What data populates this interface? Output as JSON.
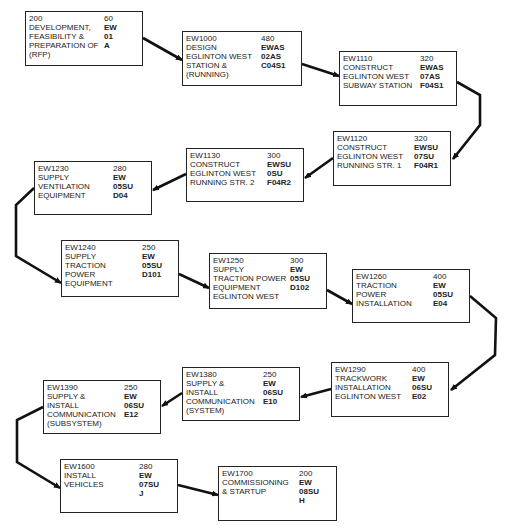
{
  "diagram": {
    "type": "activity-flow",
    "nodes": [
      {
        "id": "n0",
        "x": 25,
        "y": 11,
        "w": 118,
        "h": 55,
        "rx": 78,
        "lines": [
          "200",
          "DEVELOPMENT,",
          "FEASIBILITY &",
          "PREPARATION OF",
          "(RFP)"
        ],
        "right": [
          "60",
          "EW",
          "01",
          "A"
        ]
      },
      {
        "id": "n1",
        "x": 182,
        "y": 31,
        "w": 120,
        "h": 55,
        "rx": 78,
        "lines": [
          "EW1000",
          "DESIGN",
          "EGLINTON WEST",
          "STATION &",
          "(RUNNING)"
        ],
        "right": [
          "480",
          "EWAS",
          "02AS",
          "C04S1"
        ]
      },
      {
        "id": "n2",
        "x": 339,
        "y": 51,
        "w": 118,
        "h": 55,
        "rx": 80,
        "lines": [
          "EW1110",
          "CONSTRUCT",
          "EGLINTON WEST",
          "SUBWAY STATION"
        ],
        "right": [
          "320",
          "EWAS",
          "07AS",
          "F04S1"
        ]
      },
      {
        "id": "n3",
        "x": 333,
        "y": 131,
        "w": 118,
        "h": 55,
        "rx": 80,
        "lines": [
          "EW1120",
          "CONSTRUCT",
          "EGLINTON WEST",
          "RUNNING STR. 1"
        ],
        "right": [
          "320",
          "EWSU",
          "07SU",
          "F04R1"
        ]
      },
      {
        "id": "n4",
        "x": 186,
        "y": 148,
        "w": 118,
        "h": 54,
        "rx": 80,
        "lines": [
          "EW1130",
          "CONSTRUCT",
          "EGLINTON WEST",
          "RUNNING STR. 2"
        ],
        "right": [
          "300",
          "EWSU",
          "0SU",
          "F04R2"
        ]
      },
      {
        "id": "n5",
        "x": 34,
        "y": 161,
        "w": 118,
        "h": 54,
        "rx": 78,
        "lines": [
          "EW1230",
          "SUPPLY",
          "VENTILATION",
          "EQUIPMENT"
        ],
        "right": [
          "280",
          "EW",
          "05SU",
          "D04"
        ]
      },
      {
        "id": "n6",
        "x": 61,
        "y": 240,
        "w": 118,
        "h": 57,
        "rx": 80,
        "lines": [
          "EW1240",
          "SUPPLY",
          "TRACTION",
          "POWER",
          "EQUIPMENT"
        ],
        "right": [
          "250",
          "EW",
          "05SU",
          "D101"
        ]
      },
      {
        "id": "n7",
        "x": 209,
        "y": 253,
        "w": 118,
        "h": 56,
        "rx": 80,
        "lines": [
          "EW1250",
          "SUPPLY",
          "TRACTION POWER",
          "EQUIPMENT",
          "EGLINTON WEST"
        ],
        "right": [
          "300",
          "EW",
          "05SU",
          "D102"
        ]
      },
      {
        "id": "n8",
        "x": 352,
        "y": 269,
        "w": 118,
        "h": 54,
        "rx": 80,
        "lines": [
          "EW1260",
          "TRACTION",
          "POWER",
          "INSTALLATION"
        ],
        "right": [
          "400",
          "EW",
          "05SU",
          "E04"
        ]
      },
      {
        "id": "n9",
        "x": 331,
        "y": 362,
        "w": 118,
        "h": 55,
        "rx": 80,
        "lines": [
          "EW1290",
          "TRACKWORK",
          "INSTALLATION",
          "EGLINTON WEST"
        ],
        "right": [
          "400",
          "EW",
          "06SU",
          "E02"
        ]
      },
      {
        "id": "n10",
        "x": 182,
        "y": 367,
        "w": 118,
        "h": 54,
        "rx": 80,
        "lines": [
          "EW1380",
          "SUPPLY &",
          "INSTALL",
          "COMMUNICATION",
          "(SYSTEM)"
        ],
        "right": [
          "250",
          "EW",
          "06SU",
          "E10"
        ]
      },
      {
        "id": "n11",
        "x": 43,
        "y": 380,
        "w": 118,
        "h": 54,
        "rx": 80,
        "lines": [
          "EW1390",
          "SUPPLY &",
          "INSTALL",
          "COMMUNICATION",
          "(SUBSYSTEM)"
        ],
        "right": [
          "250",
          "EW",
          "06SU",
          "E12"
        ]
      },
      {
        "id": "n12",
        "x": 60,
        "y": 459,
        "w": 118,
        "h": 54,
        "rx": 78,
        "lines": [
          "EW1600",
          "INSTALL",
          "VEHICLES"
        ],
        "right": [
          "280",
          "EW",
          "07SU",
          "J"
        ]
      },
      {
        "id": "n13",
        "x": 218,
        "y": 466,
        "w": 119,
        "h": 55,
        "rx": 80,
        "lines": [
          "EW1700",
          "COMMISSIONING",
          "& STARTUP"
        ],
        "right": [
          "200",
          "EW",
          "08SU",
          "H"
        ]
      }
    ],
    "edges": [
      {
        "from": "n0",
        "to": "n1",
        "points": "143,38 182,60"
      },
      {
        "from": "n1",
        "to": "n2",
        "points": "302,64 339,76"
      },
      {
        "from": "n2",
        "to": "n3",
        "points": "457,82 480,95 480,125 453,159"
      },
      {
        "from": "n3",
        "to": "n4",
        "points": "333,158 305,178"
      },
      {
        "from": "n4",
        "to": "n5",
        "points": "186,174 153,190"
      },
      {
        "from": "n5",
        "to": "n6",
        "points": "34,188 16,205 16,256 61,283"
      },
      {
        "from": "n6",
        "to": "n7",
        "points": "179,274 209,288"
      },
      {
        "from": "n7",
        "to": "n8",
        "points": "327,290 352,304"
      },
      {
        "from": "n8",
        "to": "n9",
        "points": "470,296 496,318 495,355 451,390"
      },
      {
        "from": "n9",
        "to": "n10",
        "points": "331,389 301,397"
      },
      {
        "from": "n10",
        "to": "n11",
        "points": "182,393 162,406"
      },
      {
        "from": "n11",
        "to": "n12",
        "points": "43,407 17,420 17,462 60,488"
      },
      {
        "from": "n12",
        "to": "n13",
        "points": "178,485 218,495"
      }
    ]
  }
}
